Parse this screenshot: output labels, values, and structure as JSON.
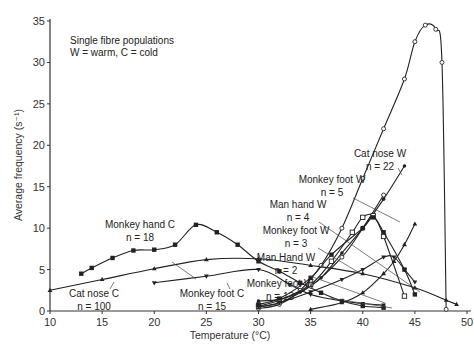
{
  "annotation": {
    "line1": "Single fibre populations",
    "line2": "W = warm, C = cold"
  },
  "axes": {
    "xlabel": "Temperature (°C)",
    "ylabel": "Average frequency (s⁻¹)",
    "xticks": [
      10,
      15,
      20,
      25,
      30,
      35,
      40,
      45,
      50
    ],
    "yticks": [
      0,
      5,
      10,
      15,
      20,
      25,
      30,
      35
    ]
  },
  "chart_data": {
    "type": "line",
    "title": "",
    "annotation": "Single fibre populations; W = warm, C = cold",
    "xlabel": "Temperature (°C)",
    "ylabel": "Average frequency (s⁻¹)",
    "xlim": [
      10,
      50
    ],
    "ylim": [
      0,
      35
    ],
    "grid": false,
    "legend": "inline labels with leader lines",
    "series": [
      {
        "name": "Monkey hand C",
        "n": 18,
        "marker": "filled-square",
        "label": "Monkey hand C",
        "n_label": "n = 18",
        "x": [
          13,
          14,
          16,
          18,
          20,
          22,
          24,
          26,
          28,
          30,
          32,
          34,
          36,
          38,
          40,
          42
        ],
        "y": [
          4.5,
          5.2,
          6.4,
          7.3,
          7.4,
          8.0,
          10.4,
          9.5,
          8.0,
          6.0,
          4.8,
          3.4,
          2.2,
          1.2,
          0.6,
          0.4
        ]
      },
      {
        "name": "Cat nose C",
        "n": 100,
        "marker": "filled-triangle",
        "label": "Cat nose C",
        "n_label": "n = 100",
        "x": [
          10,
          15,
          20,
          25,
          30,
          35,
          40,
          45,
          48,
          49
        ],
        "y": [
          2.5,
          3.8,
          5.1,
          6.2,
          6.3,
          5.5,
          4.5,
          2.8,
          1.3,
          0.8
        ]
      },
      {
        "name": "Monkey foot C",
        "n": 15,
        "marker": "filled-down-triangle",
        "label": "Monkey foot C",
        "n_label": "n = 15",
        "x": [
          20,
          25,
          30,
          33,
          35,
          38,
          40,
          42
        ],
        "y": [
          3.4,
          4.2,
          5.0,
          3.2,
          2.0,
          1.2,
          0.9,
          0.7
        ]
      },
      {
        "name": "Cat nose W",
        "n": 22,
        "marker": "open-circle",
        "label": "Cat nose W",
        "n_label": "n = 22",
        "x": [
          30,
          32,
          34,
          36,
          38,
          40,
          42,
          44,
          45,
          46,
          47,
          47.6,
          48
        ],
        "y": [
          0.3,
          0.8,
          2.5,
          5.5,
          10.0,
          16.0,
          22.0,
          28.0,
          32.5,
          34.5,
          34.0,
          30.0,
          0.2
        ]
      },
      {
        "name": "Monkey foot W",
        "n": 5,
        "marker": "filled-circle",
        "label": "Monkey foot W",
        "n_label": "n = 5",
        "x": [
          30,
          32,
          34,
          36,
          38,
          40,
          42,
          44
        ],
        "y": [
          1.2,
          1.4,
          2.3,
          4.0,
          7.0,
          10.0,
          13.5,
          17.5
        ]
      },
      {
        "name": "Man hand W",
        "n": 4,
        "marker": "open-circle",
        "label": "Man hand W",
        "n_label": "n = 4",
        "x": [
          30,
          32,
          35,
          38,
          40,
          42
        ],
        "y": [
          0.5,
          1.0,
          3.0,
          6.5,
          10.0,
          14.0
        ]
      },
      {
        "name": "Monkey foot W",
        "n": 3,
        "marker": "open-square",
        "label": "Monkey foot W",
        "n_label": "n = 3",
        "x": [
          30,
          32,
          35,
          37,
          39,
          40,
          41,
          42,
          44
        ],
        "y": [
          0.6,
          1.3,
          3.2,
          6.0,
          9.5,
          11.3,
          11.5,
          9.0,
          1.8
        ]
      },
      {
        "name": "Man Hand W",
        "n": 2,
        "marker": "filled-square",
        "label": "Man Hand W",
        "n_label": "n = 2",
        "x": [
          30,
          32,
          35,
          37,
          40,
          41,
          42,
          44,
          45
        ],
        "y": [
          0.8,
          1.5,
          4.0,
          6.8,
          10.0,
          11.3,
          9.5,
          5.0,
          2.0
        ]
      },
      {
        "name": "Monkey foot W",
        "n": 13,
        "marker": "filled-down-triangle",
        "label": "Monkey foot W",
        "n_label": "n = 13",
        "x": [
          30,
          32,
          35,
          38,
          40,
          42,
          43,
          44,
          45
        ],
        "y": [
          0.5,
          1.0,
          2.3,
          3.8,
          5.0,
          6.5,
          6.5,
          5.0,
          3.5
        ]
      },
      {
        "name": "Warm (unlabelled, triangle)",
        "n": null,
        "marker": "filled-triangle",
        "label": "",
        "n_label": "",
        "x": [
          35,
          38,
          40,
          42,
          43,
          44,
          45
        ],
        "y": [
          0.2,
          1.0,
          2.2,
          4.5,
          6.0,
          8.0,
          10.5
        ]
      }
    ]
  }
}
